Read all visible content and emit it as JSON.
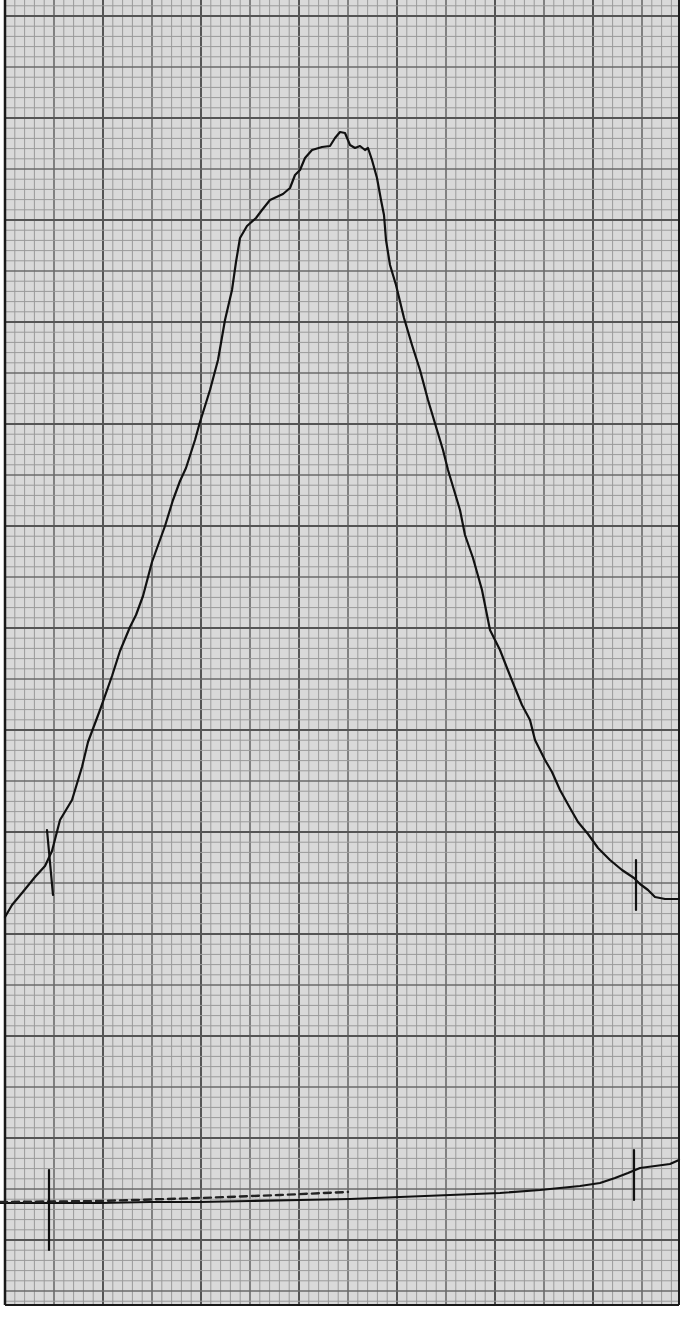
{
  "chart_data": {
    "type": "line",
    "title": "",
    "xlabel": "",
    "ylabel": "",
    "grid": true,
    "legend": null,
    "paper": {
      "x0": 5,
      "y0": 0,
      "x1": 679,
      "y1": 1305,
      "minor_px": 9.8,
      "medium_px": 49,
      "major_px": 98,
      "background": "#d9d9d9",
      "minor_color": "#9a9a9a",
      "major_color": "#555555",
      "border_color": "#1a1a1a"
    },
    "series": [
      {
        "name": "peak-trace",
        "color": "#111111",
        "points_px": [
          [
            5,
            917
          ],
          [
            12,
            905
          ],
          [
            22,
            893
          ],
          [
            35,
            877
          ],
          [
            45,
            866
          ],
          [
            52,
            851
          ],
          [
            60,
            820
          ],
          [
            72,
            800
          ],
          [
            82,
            767
          ],
          [
            88,
            742
          ],
          [
            100,
            710
          ],
          [
            112,
            676
          ],
          [
            120,
            651
          ],
          [
            130,
            627
          ],
          [
            136,
            615
          ],
          [
            143,
            596
          ],
          [
            152,
            562
          ],
          [
            165,
            526
          ],
          [
            173,
            500
          ],
          [
            180,
            481
          ],
          [
            186,
            468
          ],
          [
            195,
            440
          ],
          [
            200,
            422
          ],
          [
            210,
            390
          ],
          [
            218,
            360
          ],
          [
            225,
            320
          ],
          [
            232,
            290
          ],
          [
            236,
            262
          ],
          [
            240,
            238
          ],
          [
            247,
            226
          ],
          [
            256,
            218
          ],
          [
            262,
            210
          ],
          [
            270,
            200
          ],
          [
            283,
            194
          ],
          [
            290,
            188
          ],
          [
            295,
            175
          ],
          [
            300,
            170
          ],
          [
            305,
            158
          ],
          [
            312,
            150
          ],
          [
            322,
            147
          ],
          [
            330,
            146
          ],
          [
            335,
            138
          ],
          [
            340,
            132
          ],
          [
            345,
            133
          ],
          [
            350,
            145
          ],
          [
            355,
            148
          ],
          [
            360,
            146
          ],
          [
            365,
            150
          ],
          [
            368,
            148
          ],
          [
            372,
            160
          ],
          [
            377,
            178
          ],
          [
            381,
            200
          ],
          [
            384,
            215
          ],
          [
            386,
            240
          ],
          [
            390,
            265
          ],
          [
            396,
            285
          ],
          [
            404,
            318
          ],
          [
            412,
            345
          ],
          [
            420,
            370
          ],
          [
            428,
            400
          ],
          [
            437,
            430
          ],
          [
            443,
            450
          ],
          [
            448,
            470
          ],
          [
            454,
            490
          ],
          [
            460,
            510
          ],
          [
            465,
            535
          ],
          [
            473,
            558
          ],
          [
            482,
            590
          ],
          [
            490,
            630
          ],
          [
            500,
            650
          ],
          [
            507,
            668
          ],
          [
            515,
            688
          ],
          [
            522,
            705
          ],
          [
            530,
            720
          ],
          [
            535,
            740
          ],
          [
            545,
            760
          ],
          [
            552,
            772
          ],
          [
            560,
            790
          ],
          [
            570,
            808
          ],
          [
            578,
            822
          ],
          [
            588,
            834
          ],
          [
            598,
            848
          ],
          [
            610,
            860
          ],
          [
            622,
            870
          ],
          [
            634,
            878
          ],
          [
            640,
            884
          ],
          [
            648,
            890
          ],
          [
            655,
            897
          ],
          [
            665,
            899
          ],
          [
            679,
            899
          ]
        ]
      },
      {
        "name": "baseline-trace",
        "color": "#111111",
        "points_px": [
          [
            0,
            1203
          ],
          [
            50,
            1203
          ],
          [
            100,
            1203
          ],
          [
            150,
            1202
          ],
          [
            200,
            1202
          ],
          [
            250,
            1201
          ],
          [
            300,
            1200
          ],
          [
            350,
            1199
          ],
          [
            400,
            1197
          ],
          [
            450,
            1195
          ],
          [
            500,
            1193
          ],
          [
            540,
            1190
          ],
          [
            580,
            1186
          ],
          [
            600,
            1183
          ],
          [
            615,
            1178
          ],
          [
            628,
            1173
          ],
          [
            640,
            1168
          ],
          [
            655,
            1166
          ],
          [
            670,
            1164
          ],
          [
            679,
            1160
          ]
        ]
      },
      {
        "name": "dashed-overlay",
        "color": "#222222",
        "dashed": true,
        "points_px": [
          [
            0,
            1202
          ],
          [
            100,
            1201
          ],
          [
            200,
            1198
          ],
          [
            280,
            1195
          ],
          [
            348,
            1192
          ]
        ]
      }
    ],
    "markers": [
      {
        "name": "peak-start-marker",
        "x1": 47,
        "y1": 830,
        "x2": 53,
        "y2": 895
      },
      {
        "name": "peak-end-marker",
        "x1": 636,
        "y1": 860,
        "x2": 636,
        "y2": 910
      },
      {
        "name": "baseline-start-marker",
        "x1": 49,
        "y1": 1170,
        "x2": 49,
        "y2": 1250
      },
      {
        "name": "baseline-end-marker",
        "x1": 634,
        "y1": 1150,
        "x2": 634,
        "y2": 1200
      }
    ],
    "peak": {
      "apex_px": [
        340,
        132
      ],
      "start_px": [
        50,
        862
      ],
      "end_px": [
        636,
        880
      ]
    }
  }
}
